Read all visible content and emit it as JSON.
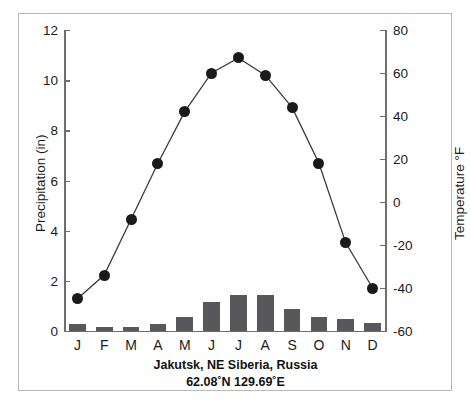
{
  "chart_data": {
    "type": "line",
    "title": "Jakutsk, NE Siberia, Russia",
    "subtitle": "62.08˚N 129.69˚E",
    "xlabel": "",
    "categories": [
      "J",
      "F",
      "M",
      "A",
      "M",
      "J",
      "J",
      "A",
      "S",
      "O",
      "N",
      "D"
    ],
    "month_names": [
      "January",
      "February",
      "March",
      "April",
      "May",
      "June",
      "July",
      "August",
      "September",
      "October",
      "November",
      "December"
    ],
    "left_axis": {
      "label": "Precipitation (in)",
      "ticks": [
        "0",
        "2",
        "4",
        "6",
        "8",
        "10",
        "12"
      ],
      "tick_values": [
        0,
        2,
        4,
        6,
        8,
        10,
        12
      ],
      "ylim": [
        0,
        12
      ],
      "unit": "in"
    },
    "right_axis": {
      "label": "Temperature °F",
      "ticks": [
        "-60",
        "-40",
        "-20",
        "0",
        "20",
        "40",
        "60",
        "80"
      ],
      "tick_values": [
        -60,
        -40,
        -20,
        0,
        20,
        40,
        60,
        80
      ],
      "ylim": [
        -60,
        80
      ],
      "unit": "°F"
    },
    "series": [
      {
        "name": "Precipitation",
        "render": "bar",
        "axis": "left",
        "color": "#58585c",
        "values": [
          0.28,
          0.17,
          0.17,
          0.28,
          0.55,
          1.15,
          1.45,
          1.45,
          0.87,
          0.55,
          0.48,
          0.3
        ]
      },
      {
        "name": "Temperature",
        "render": "line-marker",
        "axis": "right",
        "color": "#1a1a1a",
        "values": [
          -45,
          -34,
          -8,
          18,
          42,
          60,
          67,
          59,
          44,
          18,
          -19,
          -40
        ]
      }
    ],
    "grid": false,
    "legend": "none"
  },
  "figure": {
    "frame_color": "#b9b9b9",
    "axis_color": "#6e6e6e",
    "background": "#ffffff"
  }
}
